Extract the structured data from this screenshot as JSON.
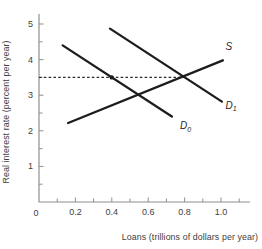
{
  "chart_data": {
    "type": "line",
    "title": "",
    "xlabel": "Loans (trillions of dollars per year)",
    "ylabel": "Real interest rate (percent per year)",
    "origin_label": "0",
    "xlim": [
      0,
      1.16
    ],
    "ylim": [
      0,
      5.28
    ],
    "grid": false,
    "x_ticks": {
      "major": [
        0.2,
        0.4,
        0.6,
        0.8,
        1.0
      ],
      "labels": [
        "0.2",
        "0.4",
        "0.6",
        "0.8",
        "1.0"
      ],
      "minor": [
        0.1,
        0.3,
        0.5,
        0.7,
        0.9,
        1.1
      ]
    },
    "y_ticks": {
      "major": [
        1,
        2,
        3,
        4,
        5
      ],
      "labels": [
        "1",
        "2",
        "3",
        "4",
        "5"
      ],
      "minor": [
        0.5,
        1.5,
        2.5,
        3.5,
        4.5
      ]
    },
    "series": [
      {
        "name": "supply",
        "label": "S",
        "label_sub": "",
        "points": [
          [
            0.16,
            2.22
          ],
          [
            1.01,
            3.98
          ]
        ],
        "label_at": [
          1.025,
          4.27
        ]
      },
      {
        "name": "demand-initial",
        "label": "D",
        "label_sub": "0",
        "points": [
          [
            0.13,
            4.4
          ],
          [
            0.73,
            2.4
          ]
        ],
        "label_at": [
          0.775,
          2.05
        ]
      },
      {
        "name": "demand-new",
        "label": "D",
        "label_sub": "1",
        "points": [
          [
            0.39,
            4.87
          ],
          [
            1.005,
            2.82
          ]
        ],
        "label_at": [
          1.025,
          2.62
        ]
      }
    ],
    "equilibrium": {
      "reference_rate": 3.5,
      "dashed_from_x": 0,
      "dashed_to_x": 0.8,
      "marker_point": [
        0.4,
        3.5
      ]
    },
    "colors": {
      "axis": "#8f8f8f",
      "tick_text": "#3e3e3e",
      "curve": "#1c1c1c",
      "dashed": "#2b2b2b",
      "marker": "#1c1c1c",
      "background": "#ffffff"
    }
  }
}
